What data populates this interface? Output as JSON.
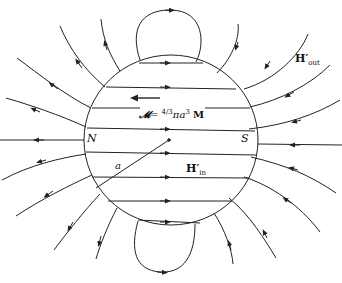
{
  "diagram": {
    "labels": {
      "north_pole": "N",
      "south_pole": "S",
      "radius": "a",
      "moment_lhs": "𝓜",
      "moment_eq": "= ",
      "moment_frac": "4/3",
      "moment_rhs": "πa",
      "moment_exp": "3",
      "moment_vec": "M",
      "h_out_base": "H′",
      "h_out_sub": "out",
      "h_in_base": "H′",
      "h_in_sub": "in"
    },
    "colors": {
      "line": "#222222",
      "background": "#ffffff"
    }
  }
}
